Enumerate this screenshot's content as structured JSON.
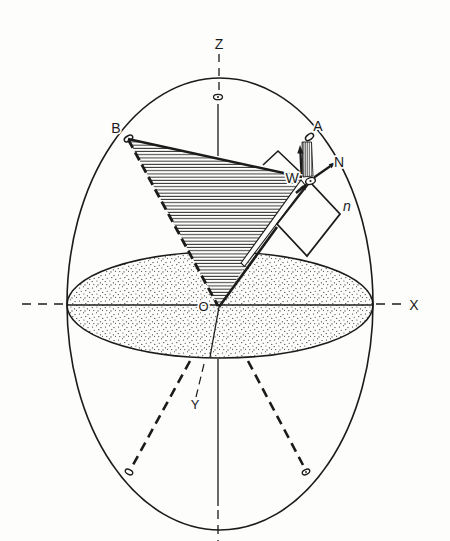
{
  "figure": {
    "type": "line-diagram",
    "colors": {
      "ink": "#1b1b1b",
      "paper": "#fdfdfc"
    },
    "labels": {
      "axis_z": "Z",
      "axis_x": "X",
      "axis_y": "Y",
      "origin": "O",
      "point_a": "A",
      "point_b": "B",
      "normal_n_arrow": "N",
      "point_w": "W",
      "plane_n": "n"
    }
  }
}
